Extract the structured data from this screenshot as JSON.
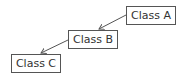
{
  "diagram": {
    "type": "class-hierarchy",
    "nodes": [
      {
        "id": "A",
        "label": "Class A"
      },
      {
        "id": "B",
        "label": "Class B"
      },
      {
        "id": "C",
        "label": "Class C"
      }
    ],
    "edges": [
      {
        "from": "A",
        "to": "B",
        "arrow": "open-arrowhead"
      },
      {
        "from": "B",
        "to": "C",
        "arrow": "open-arrowhead"
      }
    ],
    "colors": {
      "stroke": "#555555",
      "text": "#333333",
      "background": "#ffffff"
    }
  }
}
